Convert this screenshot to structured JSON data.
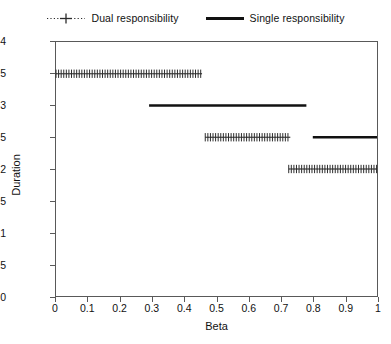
{
  "chart_data": {
    "type": "line",
    "title": "",
    "xlabel": "Beta",
    "ylabel": "Duration",
    "xlim": [
      0,
      1
    ],
    "ylim": [
      0,
      4
    ],
    "xticks": [
      "0",
      "0.1",
      "0.2",
      "0.3",
      "0.4",
      "0.5",
      "0.6",
      "0.7",
      "0.8",
      "0.9",
      "1"
    ],
    "xtick_values": [
      0,
      0.1,
      0.2,
      0.3,
      0.4,
      0.5,
      0.6,
      0.7,
      0.8,
      0.9,
      1
    ],
    "yticks": [
      "0",
      "0.5",
      "1",
      "1.5",
      "2",
      "2.5",
      "3",
      "3.5",
      "4"
    ],
    "ytick_values": [
      0,
      0.5,
      1,
      1.5,
      2,
      2.5,
      3,
      3.5,
      4
    ],
    "grid": false,
    "legend_position": "top-center",
    "series": [
      {
        "name": "Dual responsibility",
        "style": "dotted-plus",
        "color": "#2b2b2b",
        "segments": [
          {
            "x_start": 0.0,
            "x_end": 0.455,
            "y": 3.5
          },
          {
            "x_start": 0.465,
            "x_end": 0.73,
            "y": 2.5
          },
          {
            "x_start": 0.725,
            "x_end": 1.0,
            "y": 2.0
          }
        ]
      },
      {
        "name": "Single responsibility",
        "style": "solid-thick",
        "color": "#111111",
        "segments": [
          {
            "x_start": 0.29,
            "x_end": 0.78,
            "y": 3.0
          },
          {
            "x_start": 0.8,
            "x_end": 1.0,
            "y": 2.5
          }
        ]
      }
    ]
  },
  "legend": {
    "entries": [
      {
        "label": "Dual responsibility",
        "marker": "dotted-plus-marker-icon"
      },
      {
        "label": "Single responsibility",
        "marker": "solid-line-marker-icon"
      }
    ]
  },
  "axes": {
    "x_title": "Beta",
    "y_title": "Duration"
  },
  "colors": {
    "dual": "#2b2b2b",
    "single": "#111111",
    "frame": "#595959",
    "background": "#ffffff"
  }
}
